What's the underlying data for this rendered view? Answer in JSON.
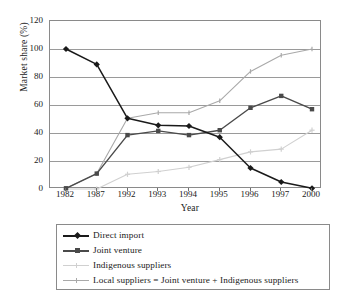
{
  "chart_data": {
    "type": "line",
    "title": "",
    "xlabel": "Year",
    "ylabel": "Market share (%)",
    "categories": [
      "1982",
      "1987",
      "1992",
      "1993",
      "1994",
      "1995",
      "1996",
      "1997",
      "2000"
    ],
    "ylim": [
      0,
      120
    ],
    "yticks": [
      0,
      20,
      40,
      60,
      80,
      100,
      120
    ],
    "grid": "horizontal",
    "legend_position": "below-axis",
    "series": [
      {
        "name": "Direct import",
        "color": "#1a1a1a",
        "marker": "diamond",
        "values": [
          100,
          89,
          50.5,
          45.5,
          45,
          37,
          15,
          5,
          0.5
        ]
      },
      {
        "name": "Joint venture",
        "color": "#4a4a4a",
        "marker": "square",
        "values": [
          0.5,
          11,
          38.5,
          41.5,
          38.5,
          42,
          58,
          66.5,
          57
        ]
      },
      {
        "name": "Indigenous suppliers",
        "color": "#d0d0d0",
        "marker": "cross",
        "values": [
          0,
          0,
          10.5,
          12.5,
          15.5,
          21,
          26.5,
          28.5,
          42
        ]
      },
      {
        "name": "Local suppliers = Joint venture + Indigenous suppliers",
        "color": "#a9a9a9",
        "marker": "tick",
        "values": [
          0.5,
          11,
          50.5,
          54.5,
          54.5,
          63,
          84,
          95.5,
          100
        ]
      }
    ]
  },
  "legend": {
    "items": [
      {
        "label": "Direct import"
      },
      {
        "label": "Joint venture"
      },
      {
        "label": "Indigenous suppliers"
      },
      {
        "label": "Local suppliers = Joint venture + Indigenous suppliers"
      }
    ]
  },
  "axes": {
    "y_title": "Market share (%)",
    "x_title": "Year",
    "y_tick_labels": [
      "0",
      "20",
      "40",
      "60",
      "80",
      "100",
      "120"
    ],
    "x_tick_labels": [
      "1982",
      "1987",
      "1992",
      "1993",
      "1994",
      "1995",
      "1996",
      "1997",
      "2000"
    ]
  }
}
